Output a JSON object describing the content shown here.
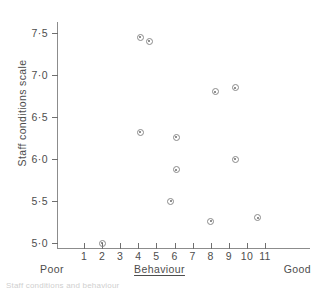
{
  "chart_data": {
    "type": "scatter",
    "title": "",
    "xlabel": "Behaviour",
    "ylabel": "Staff conditions scale",
    "xlim": [
      0,
      12.2
    ],
    "ylim": [
      4.72,
      7.67
    ],
    "grid": false,
    "legend": null,
    "x_tick_labels": [
      "1",
      "2",
      "3",
      "4",
      "5",
      "6",
      "7",
      "8",
      "9",
      "10",
      "11"
    ],
    "x_ticks": [
      1,
      2,
      3,
      4,
      5,
      6,
      7,
      8,
      9,
      10,
      11
    ],
    "y_tick_labels": [
      "7·5",
      "7·0",
      "6·5",
      "6·0",
      "5·5",
      "5·0"
    ],
    "y_ticks": [
      7.5,
      7.0,
      6.5,
      6.0,
      5.5,
      5.0
    ],
    "x_axis_end_labels": {
      "low": "Poor",
      "high": "Good"
    },
    "marker_style": "open-circle-with-centre-dot",
    "points": [
      {
        "x": 2.0,
        "y": 5.0
      },
      {
        "x": 4.1,
        "y": 7.45
      },
      {
        "x": 4.6,
        "y": 7.4
      },
      {
        "x": 4.1,
        "y": 6.32
      },
      {
        "x": 5.8,
        "y": 5.5
      },
      {
        "x": 6.1,
        "y": 6.26
      },
      {
        "x": 6.1,
        "y": 5.87
      },
      {
        "x": 8.0,
        "y": 5.26
      },
      {
        "x": 8.25,
        "y": 6.8
      },
      {
        "x": 9.35,
        "y": 6.85
      },
      {
        "x": 9.35,
        "y": 6.0
      },
      {
        "x": 10.6,
        "y": 5.3
      }
    ],
    "x_values": [
      2.0,
      4.1,
      4.6,
      4.1,
      5.8,
      6.1,
      6.1,
      8.0,
      8.25,
      9.35,
      9.35,
      10.6
    ],
    "y_values": [
      5.0,
      7.45,
      7.4,
      6.32,
      5.5,
      6.26,
      5.87,
      5.26,
      6.8,
      6.85,
      6.0,
      5.3
    ]
  },
  "colors": {
    "axis": "#8c8c8c",
    "tick": "#6f6f6f",
    "text": "#4d4d4d",
    "marker_edge": "#8a8a8a",
    "marker_dot": "#6b6b6b",
    "background": "#ffffff"
  },
  "footer": {
    "clipped_text": "Staff conditions and behaviour"
  }
}
